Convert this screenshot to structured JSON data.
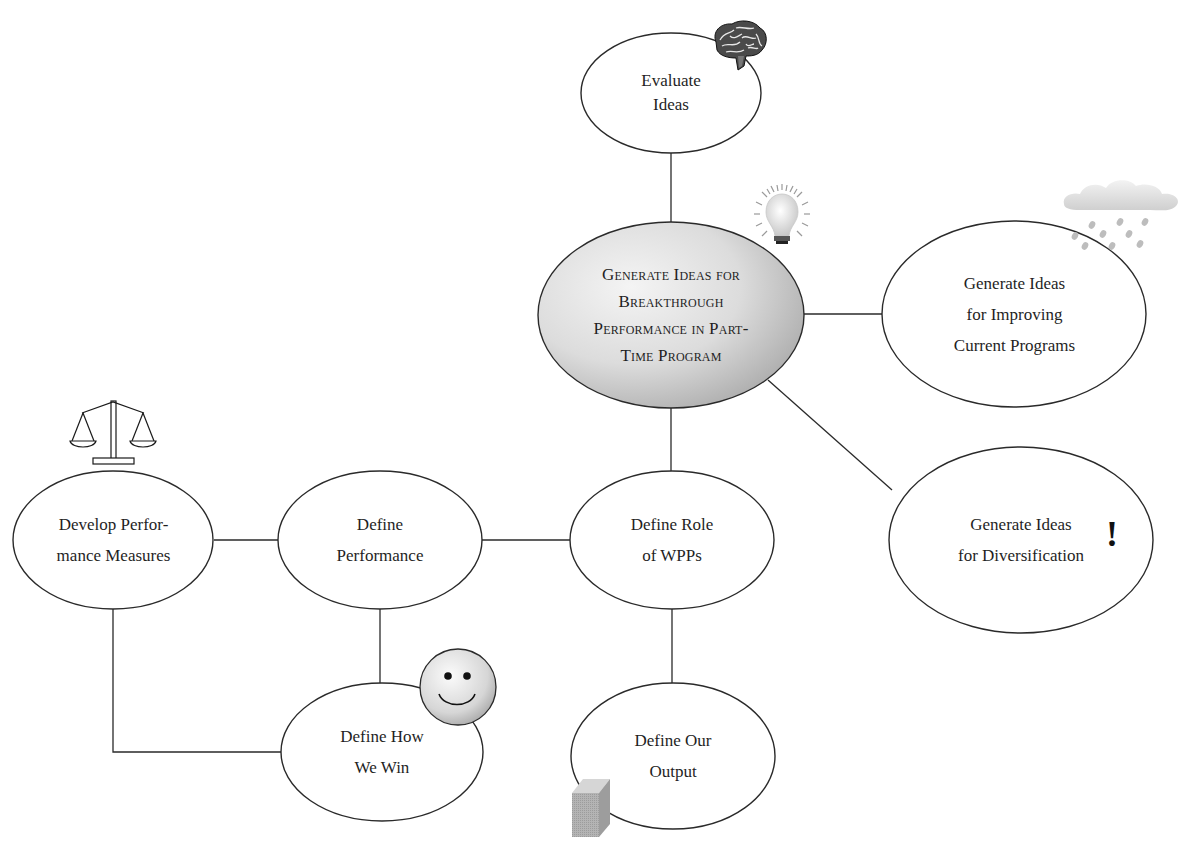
{
  "diagram": {
    "type": "mind-map",
    "central_node": {
      "id": "generate-breakthrough",
      "lines": [
        "Generate Ideas for",
        "Breakthrough",
        "Performance in Part-",
        "Time Program"
      ],
      "icon": "lightbulb-icon"
    },
    "nodes": [
      {
        "id": "evaluate-ideas",
        "lines": [
          "Evaluate",
          "Ideas"
        ],
        "icon": "brain-icon"
      },
      {
        "id": "improving-current",
        "lines": [
          "Generate Ideas",
          "for Improving",
          "Current Programs"
        ],
        "icon": "rain-cloud-icon"
      },
      {
        "id": "diversification",
        "lines": [
          "Generate Ideas",
          "for Diversification"
        ],
        "icon": "exclamation-icon",
        "icon_glyph": "!"
      },
      {
        "id": "define-role",
        "lines": [
          "Define Role",
          "of WPPs"
        ]
      },
      {
        "id": "define-performance",
        "lines": [
          "Define",
          "Performance"
        ]
      },
      {
        "id": "develop-measures",
        "lines": [
          "Develop Perfor-",
          "mance Measures"
        ],
        "icon": "scales-icon"
      },
      {
        "id": "define-how-we-win",
        "lines": [
          "Define How",
          "We Win"
        ],
        "icon": "smiley-icon"
      },
      {
        "id": "define-output",
        "lines": [
          "Define Our",
          "Output"
        ],
        "icon": "cube-icon"
      }
    ],
    "edges": [
      [
        "generate-breakthrough",
        "evaluate-ideas"
      ],
      [
        "generate-breakthrough",
        "improving-current"
      ],
      [
        "generate-breakthrough",
        "diversification"
      ],
      [
        "generate-breakthrough",
        "define-role"
      ],
      [
        "define-role",
        "define-performance"
      ],
      [
        "define-role",
        "define-output"
      ],
      [
        "define-performance",
        "develop-measures"
      ],
      [
        "define-performance",
        "define-how-we-win"
      ],
      [
        "develop-measures",
        "define-how-we-win"
      ]
    ],
    "colors": {
      "stroke": "#2a2a2a",
      "central_fill_light": "#f2f2f2",
      "central_fill_dark": "#b5b5b5",
      "node_fill": "#ffffff"
    }
  }
}
